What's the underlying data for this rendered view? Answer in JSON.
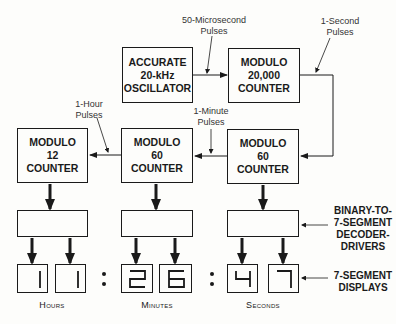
{
  "diagram": {
    "blocks": {
      "oscillator": [
        "ACCURATE",
        "20-kHz",
        "OSCILLATOR"
      ],
      "mod20000": [
        "MODULO",
        "20,000",
        "COUNTER"
      ],
      "mod60_seconds": [
        "MODULO",
        "60",
        "COUNTER"
      ],
      "mod60_minutes": [
        "MODULO",
        "60",
        "COUNTER"
      ],
      "mod12_hours": [
        "MODULO",
        "12",
        "COUNTER"
      ]
    },
    "pulse_labels": {
      "microsecond": [
        "50-Microsecond",
        "Pulses"
      ],
      "second": [
        "1-Second",
        "Pulses"
      ],
      "minute": [
        "1-Minute",
        "Pulses"
      ],
      "hour": [
        "1-Hour",
        "Pulses"
      ]
    },
    "side_labels": {
      "decoders": [
        "BINARY-TO-",
        "7-SEGMENT",
        "DECODER-",
        "DRIVERS"
      ],
      "displays": [
        "7-SEGMENT",
        "DISPLAYS"
      ]
    },
    "display_digits": {
      "hours": [
        "1",
        "1"
      ],
      "minutes": [
        "2",
        "6"
      ],
      "seconds": [
        "4",
        "7"
      ]
    },
    "group_labels": {
      "hours": "Hours",
      "minutes": "Minutes",
      "seconds": "Seconds"
    }
  }
}
